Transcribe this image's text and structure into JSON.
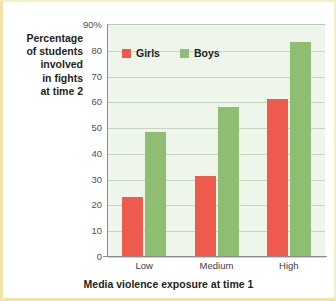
{
  "chart_data": {
    "type": "bar",
    "title": "",
    "categories": [
      "Low",
      "Medium",
      "High"
    ],
    "series": [
      {
        "name": "Girls",
        "values": [
          23,
          31,
          61
        ],
        "color": "#ee5a4e"
      },
      {
        "name": "Boys",
        "values": [
          48,
          58,
          83
        ],
        "color": "#8fbd71"
      }
    ],
    "xlabel": "Media violence exposure at time 1",
    "ylabel": "Percentage of students involved in fights at time 2",
    "ylabel_lines": [
      "Percentage",
      "of students",
      "involved",
      "in fights",
      "at time 2"
    ],
    "ylim": [
      0,
      90
    ],
    "ytick_values": [
      90,
      80,
      70,
      60,
      50,
      40,
      30,
      20,
      10,
      0
    ],
    "ytick_labels": [
      "90%",
      "80",
      "70",
      "60",
      "50",
      "40",
      "30",
      "20",
      "10",
      "0"
    ],
    "grid": true,
    "legend_position": "inside-top-left",
    "plot_background": "#eef6ec",
    "frame_color": "#f2e2a8"
  },
  "legend": {
    "items": [
      {
        "label": "Girls"
      },
      {
        "label": "Boys"
      }
    ]
  }
}
